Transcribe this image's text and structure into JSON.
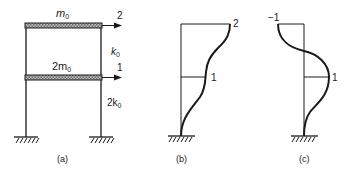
{
  "figure_a": {
    "caption": "(a)",
    "top_mass": {
      "label": "m",
      "sub": "0"
    },
    "bottom_mass": {
      "label": "2m",
      "sub": "0"
    },
    "top_stiffness": {
      "label": "k",
      "sub": "0"
    },
    "bottom_stiffness": {
      "label": "2k",
      "sub": "0"
    },
    "top_dof": "2",
    "bottom_dof": "1"
  },
  "figure_b": {
    "caption": "(b)",
    "top_label": "2",
    "mid_label": "1"
  },
  "figure_c": {
    "caption": "(c)",
    "top_label": "−1",
    "mid_label": "1"
  },
  "colors": {
    "ink": "#1a1a1a",
    "beam_fill": "#9a9a9a"
  }
}
